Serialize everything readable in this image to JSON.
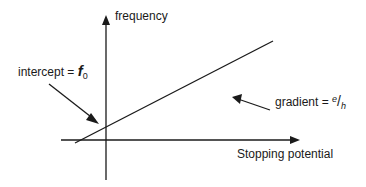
{
  "diagram": {
    "y_axis_label": "frequency",
    "x_axis_label": "Stopping potential",
    "intercept_label": {
      "text": "intercept = ",
      "symbol": "f",
      "subscript": "0"
    },
    "gradient_label": {
      "text": "gradient = ",
      "numerator": "e",
      "slash": "/",
      "denominator": "h"
    },
    "line_color": "#1a1a1a"
  }
}
